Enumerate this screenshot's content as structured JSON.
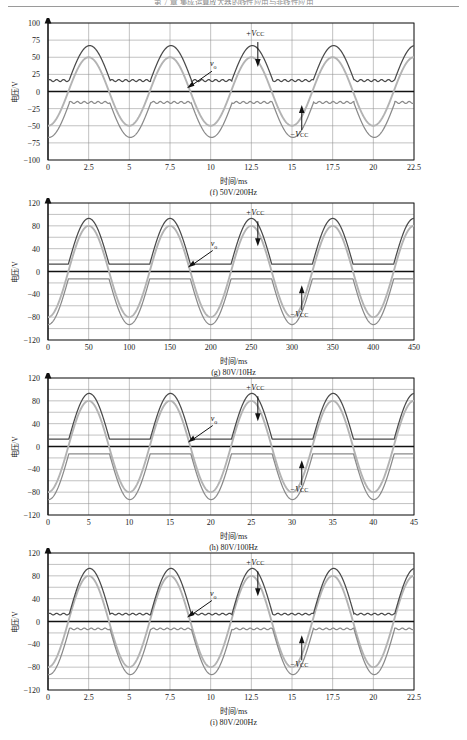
{
  "header": {
    "text": "第 7 章  集成运算放大器的线性应用与非线性应用"
  },
  "axis_labels": {
    "y": "电压/V",
    "x": "时间/ms"
  },
  "annotations": {
    "vcc_pos": "+V",
    "vcc_pos_sub": "CC",
    "vcc_neg": "−V",
    "vcc_neg_sub": "CC",
    "vo": "v",
    "vo_sub": "o"
  },
  "colors": {
    "rail_trace": "#4a4a4a",
    "signal_trace": "#b3b3b3",
    "grid": "#8f8f8f",
    "axis": "#111111",
    "frame": "#111111",
    "background": "#ffffff"
  },
  "figures": [
    {
      "id": "f",
      "caption": "(f) 50V/200Hz",
      "amplitude_label": "50V",
      "frequency_label": "200Hz"
    },
    {
      "id": "g",
      "caption": "(g) 80V/10Hz",
      "amplitude_label": "80V",
      "frequency_label": "10Hz"
    },
    {
      "id": "h",
      "caption": "(h) 80V/100Hz",
      "amplitude_label": "80V",
      "frequency_label": "100Hz"
    },
    {
      "id": "i",
      "caption": "(i) 80V/200Hz",
      "amplitude_label": "80V",
      "frequency_label": "200Hz"
    }
  ],
  "chart_data": [
    {
      "type": "line",
      "id": "f",
      "title": "(f) 50V/200Hz",
      "xlabel": "时间/ms",
      "ylabel": "电压/V",
      "xlim": [
        0,
        22.5
      ],
      "ylim": [
        -100,
        100
      ],
      "xticks": [
        0,
        2.5,
        5,
        7.5,
        10,
        12.5,
        15,
        17.5,
        20,
        22.5
      ],
      "yticks": [
        -100,
        -75,
        -50,
        -25,
        0,
        25,
        50,
        75,
        100
      ],
      "grid": true,
      "legend": "none",
      "signal_amplitude": 50,
      "signal_frequency_hz": 200,
      "period_ms": 5,
      "cycles": 4.5,
      "rail_headroom": 17,
      "rail_idle": 16,
      "rail_peak": 67,
      "neg_rail_idle": -16,
      "neg_rail_peak": -67,
      "series": [
        {
          "name": "+V_CC",
          "kind": "rail",
          "color": "#4a4a4a",
          "idle": 16,
          "peak": 67
        },
        {
          "name": "v_o",
          "kind": "signal",
          "color": "#b3b3b3",
          "amplitude": 50
        },
        {
          "name": "-V_CC",
          "kind": "rail",
          "color": "#8a8a8a",
          "idle": -16,
          "peak": -67
        }
      ],
      "annotations": [
        {
          "text": "+V_CC",
          "x": 12.9,
          "y": 78,
          "arrow": "down"
        },
        {
          "text": "v_o",
          "x": 10.2,
          "y": 34,
          "arrow": "down-left"
        },
        {
          "text": "-V_CC",
          "x": 15.6,
          "y": -62,
          "arrow": "up"
        }
      ]
    },
    {
      "type": "line",
      "id": "g",
      "title": "(g) 80V/10Hz",
      "xlabel": "时间/ms",
      "ylabel": "电压/V",
      "xlim": [
        0,
        450
      ],
      "ylim": [
        -120,
        120
      ],
      "xticks": [
        0,
        50,
        100,
        150,
        200,
        250,
        300,
        350,
        400,
        450
      ],
      "yticks": [
        -120,
        -80,
        -40,
        0,
        40,
        80,
        120
      ],
      "gridlines_minor_step": 20,
      "grid": true,
      "legend": "none",
      "signal_amplitude": 80,
      "signal_frequency_hz": 10,
      "period_ms": 100,
      "cycles": 4.5,
      "rail_headroom": 13,
      "rail_idle": 13,
      "rail_peak": 93,
      "neg_rail_idle": -13,
      "neg_rail_peak": -93,
      "series": [
        {
          "name": "+V_CC",
          "kind": "rail",
          "color": "#4a4a4a",
          "idle": 13,
          "peak": 93
        },
        {
          "name": "v_o",
          "kind": "signal",
          "color": "#b3b3b3",
          "amplitude": 80
        },
        {
          "name": "-V_CC",
          "kind": "rail",
          "color": "#8a8a8a",
          "idle": -13,
          "peak": -93
        }
      ],
      "annotations": [
        {
          "text": "+V_CC",
          "x": 258,
          "y": 95,
          "arrow": "down"
        },
        {
          "text": "v_o",
          "x": 205,
          "y": 42,
          "arrow": "down-left"
        },
        {
          "text": "-V_CC",
          "x": 312,
          "y": -75,
          "arrow": "up"
        }
      ]
    },
    {
      "type": "line",
      "id": "h",
      "title": "(h) 80V/100Hz",
      "xlabel": "时间/ms",
      "ylabel": "电压/V",
      "xlim": [
        0,
        45
      ],
      "ylim": [
        -120,
        120
      ],
      "xticks": [
        0,
        5,
        10,
        15,
        20,
        25,
        30,
        35,
        40,
        45
      ],
      "yticks": [
        -120,
        -80,
        -40,
        0,
        40,
        80,
        120
      ],
      "gridlines_minor_step": 20,
      "grid": true,
      "legend": "none",
      "signal_amplitude": 80,
      "signal_frequency_hz": 100,
      "period_ms": 10,
      "cycles": 4.5,
      "rail_headroom": 13,
      "rail_idle": 13,
      "rail_peak": 93,
      "neg_rail_idle": -13,
      "neg_rail_peak": -93,
      "series": [
        {
          "name": "+V_CC",
          "kind": "rail",
          "color": "#4a4a4a",
          "idle": 13,
          "peak": 93
        },
        {
          "name": "v_o",
          "kind": "signal",
          "color": "#b3b3b3",
          "amplitude": 80
        },
        {
          "name": "-V_CC",
          "kind": "rail",
          "color": "#8a8a8a",
          "idle": -13,
          "peak": -93
        }
      ],
      "annotations": [
        {
          "text": "+V_CC",
          "x": 25.8,
          "y": 95,
          "arrow": "down"
        },
        {
          "text": "v_o",
          "x": 20.5,
          "y": 42,
          "arrow": "down-left"
        },
        {
          "text": "-V_CC",
          "x": 31.2,
          "y": -75,
          "arrow": "up"
        }
      ]
    },
    {
      "type": "line",
      "id": "i",
      "title": "(i) 80V/200Hz",
      "xlabel": "时间/ms",
      "ylabel": "电压/V",
      "xlim": [
        0,
        22.5
      ],
      "ylim": [
        -120,
        120
      ],
      "xticks": [
        0,
        2.5,
        5,
        7.5,
        10,
        12.5,
        15,
        17.5,
        20,
        22.5
      ],
      "yticks": [
        -120,
        -80,
        -40,
        0,
        40,
        80,
        120
      ],
      "gridlines_minor_step": 20,
      "grid": true,
      "legend": "none",
      "signal_amplitude": 80,
      "signal_frequency_hz": 200,
      "period_ms": 5,
      "cycles": 4.5,
      "rail_headroom": 13,
      "rail_idle": 13,
      "rail_peak": 93,
      "neg_rail_idle": -13,
      "neg_rail_peak": -93,
      "series": [
        {
          "name": "+V_CC",
          "kind": "rail",
          "color": "#4a4a4a",
          "idle": 13,
          "peak": 93
        },
        {
          "name": "v_o",
          "kind": "signal",
          "color": "#b3b3b3",
          "amplitude": 80
        },
        {
          "name": "-V_CC",
          "kind": "rail",
          "color": "#8a8a8a",
          "idle": -13,
          "peak": -93
        }
      ],
      "annotations": [
        {
          "text": "+V_CC",
          "x": 12.9,
          "y": 95,
          "arrow": "down"
        },
        {
          "text": "v_o",
          "x": 10.2,
          "y": 42,
          "arrow": "down-left"
        },
        {
          "text": "-V_CC",
          "x": 15.6,
          "y": -75,
          "arrow": "up"
        }
      ]
    }
  ]
}
